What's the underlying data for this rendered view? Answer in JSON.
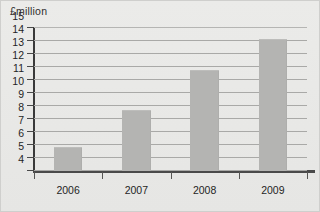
{
  "chart_data": {
    "type": "bar",
    "title": "",
    "unit_label": "£million",
    "xlabel": "",
    "ylabel": "£million",
    "categories": [
      "2006",
      "2007",
      "2008",
      "2009"
    ],
    "values": [
      5.75,
      8.6,
      11.7,
      14.1
    ],
    "series": [
      {
        "name": "£million",
        "values": [
          5.75,
          8.6,
          11.7,
          14.1
        ]
      }
    ],
    "ylim": [
      4,
      15
    ],
    "ytick_labels": [
      "4",
      "5",
      "6",
      "7",
      "8",
      "9",
      "10",
      "11",
      "12",
      "13",
      "14",
      "15"
    ],
    "ytick_values": [
      4,
      5,
      6,
      7,
      8,
      9,
      10,
      11,
      12,
      13,
      14,
      15
    ],
    "grid": true,
    "grid_axis": "y",
    "legend": false,
    "legend_position": "none",
    "axis_truncated": true,
    "bar_color": "#b4b4b2",
    "grid_color": "#a9a9a7",
    "axis_color": "#3a3a3a",
    "background_color": "#e8e8e6",
    "text_color": "#1f1f1f"
  }
}
